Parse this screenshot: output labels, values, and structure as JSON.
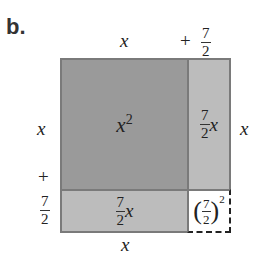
{
  "figure_label": "b.",
  "top_labels": {
    "x": "x",
    "plus": "+",
    "frac_num": "7",
    "frac_den": "2"
  },
  "left_labels": {
    "x": "x",
    "plus": "+",
    "frac_num": "7",
    "frac_den": "2"
  },
  "right_label": "x",
  "bottom_label": "x",
  "regions": {
    "square": {
      "base": "x",
      "exp": "2",
      "color": "#9a9a9a"
    },
    "right_rect": {
      "frac_num": "7",
      "frac_den": "2",
      "var": "x",
      "color": "#bcbcbc"
    },
    "bottom_rect": {
      "frac_num": "7",
      "frac_den": "2",
      "var": "x",
      "color": "#bcbcbc"
    },
    "corner": {
      "open": "(",
      "frac_num": "7",
      "frac_den": "2",
      "close": ")",
      "exp": "2",
      "color": "#ffffff",
      "border": "dashed"
    }
  }
}
